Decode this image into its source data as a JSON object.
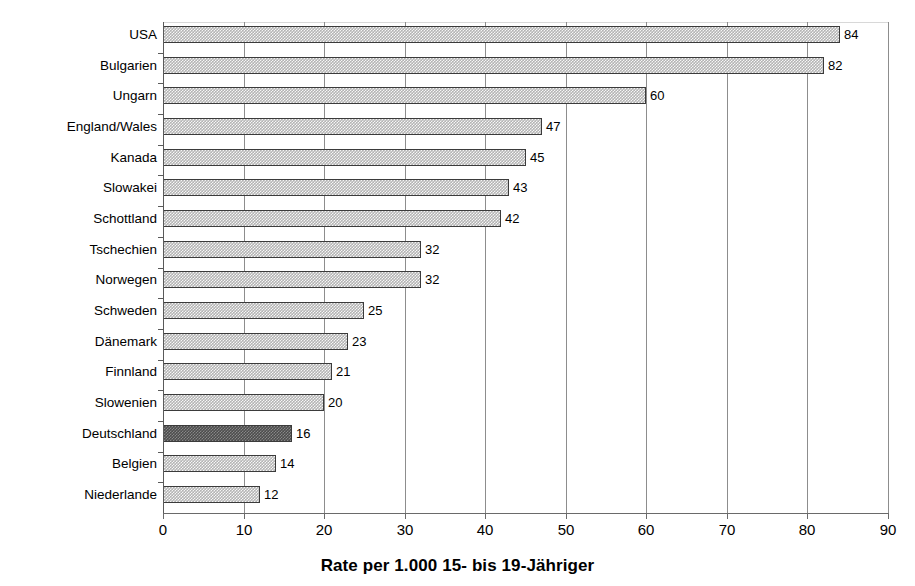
{
  "chart_data": {
    "type": "bar",
    "orientation": "horizontal",
    "title": "",
    "xlabel": "Rate per 1.000 15- bis 19-Jähriger",
    "ylabel": "",
    "xlim": [
      0,
      90
    ],
    "xticks": [
      0,
      10,
      20,
      30,
      40,
      50,
      60,
      70,
      80,
      90
    ],
    "xtick_labels": [
      "0",
      "10",
      "20",
      "30",
      "40",
      "50",
      "60",
      "70",
      "80",
      "90"
    ],
    "grid": "vertical",
    "legend": null,
    "categories": [
      "USA",
      "Bulgarien",
      "Ungarn",
      "England/Wales",
      "Kanada",
      "Slowakei",
      "Schottland",
      "Tschechien",
      "Norwegen",
      "Schweden",
      "Dänemark",
      "Finnland",
      "Slowenien",
      "Deutschland",
      "Belgien",
      "Niederlande"
    ],
    "values": [
      84,
      82,
      60,
      47,
      45,
      43,
      42,
      32,
      32,
      25,
      23,
      21,
      20,
      16,
      14,
      12
    ],
    "value_labels": [
      "84",
      "82",
      "60",
      "47",
      "45",
      "43",
      "42",
      "32",
      "32",
      "25",
      "23",
      "21",
      "20",
      "16",
      "14",
      "12"
    ],
    "highlighted_category": "Deutschland",
    "colors": {
      "bar_fill": "#b4b4b4",
      "bar_border": "#3b3b3b",
      "highlight_fill": "#4d4d4d",
      "gridline": "#8d8d8d",
      "axis": "#5a5a5a",
      "text": "#000000",
      "background": "#ffffff"
    }
  }
}
